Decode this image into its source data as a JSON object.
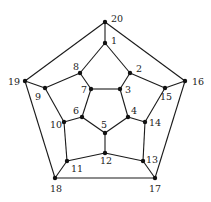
{
  "diagram": {
    "type": "graph",
    "colors": {
      "edge": "#1a1a1a",
      "node": "#111111",
      "label": "#222222"
    },
    "nodes": [
      {
        "id": "1",
        "x": 105,
        "y": 43,
        "lx": 111,
        "ly": 44
      },
      {
        "id": "2",
        "x": 130,
        "y": 73,
        "lx": 136,
        "ly": 72
      },
      {
        "id": "3",
        "x": 120,
        "y": 89,
        "lx": 125,
        "ly": 93
      },
      {
        "id": "4",
        "x": 128,
        "y": 117,
        "lx": 131,
        "ly": 114
      },
      {
        "id": "5",
        "x": 105,
        "y": 133,
        "lx": 101,
        "ly": 128
      },
      {
        "id": "6",
        "x": 82,
        "y": 117,
        "lx": 73,
        "ly": 114
      },
      {
        "id": "7",
        "x": 91,
        "y": 89,
        "lx": 81,
        "ly": 93
      },
      {
        "id": "8",
        "x": 80,
        "y": 73,
        "lx": 73,
        "ly": 70
      },
      {
        "id": "9",
        "x": 45,
        "y": 88,
        "lx": 35,
        "ly": 100
      },
      {
        "id": "10",
        "x": 64,
        "y": 122,
        "lx": 50,
        "ly": 128
      },
      {
        "id": "11",
        "x": 67,
        "y": 161,
        "lx": 71,
        "ly": 172
      },
      {
        "id": "12",
        "x": 105,
        "y": 153,
        "lx": 100,
        "ly": 164
      },
      {
        "id": "13",
        "x": 143,
        "y": 161,
        "lx": 146,
        "ly": 163
      },
      {
        "id": "14",
        "x": 145,
        "y": 122,
        "lx": 149,
        "ly": 126
      },
      {
        "id": "15",
        "x": 165,
        "y": 88,
        "lx": 160,
        "ly": 100
      },
      {
        "id": "16",
        "x": 185,
        "y": 81,
        "lx": 192,
        "ly": 85
      },
      {
        "id": "17",
        "x": 155,
        "y": 178,
        "lx": 149,
        "ly": 192
      },
      {
        "id": "18",
        "x": 55,
        "y": 178,
        "lx": 50,
        "ly": 192
      },
      {
        "id": "19",
        "x": 25,
        "y": 81,
        "lx": 8,
        "ly": 85
      },
      {
        "id": "20",
        "x": 105,
        "y": 22,
        "lx": 111,
        "ly": 22
      }
    ],
    "edges": [
      [
        "20",
        "1"
      ],
      [
        "20",
        "19"
      ],
      [
        "20",
        "16"
      ],
      [
        "1",
        "8"
      ],
      [
        "1",
        "2"
      ],
      [
        "2",
        "3"
      ],
      [
        "2",
        "15"
      ],
      [
        "3",
        "7"
      ],
      [
        "3",
        "4"
      ],
      [
        "7",
        "8"
      ],
      [
        "7",
        "6"
      ],
      [
        "8",
        "9"
      ],
      [
        "9",
        "19"
      ],
      [
        "9",
        "10"
      ],
      [
        "6",
        "10"
      ],
      [
        "6",
        "5"
      ],
      [
        "5",
        "4"
      ],
      [
        "5",
        "12"
      ],
      [
        "4",
        "14"
      ],
      [
        "14",
        "15"
      ],
      [
        "14",
        "13"
      ],
      [
        "15",
        "16"
      ],
      [
        "13",
        "12"
      ],
      [
        "13",
        "17"
      ],
      [
        "12",
        "11"
      ],
      [
        "11",
        "10"
      ],
      [
        "11",
        "18"
      ],
      [
        "18",
        "19"
      ],
      [
        "18",
        "17"
      ],
      [
        "17",
        "16"
      ]
    ]
  }
}
